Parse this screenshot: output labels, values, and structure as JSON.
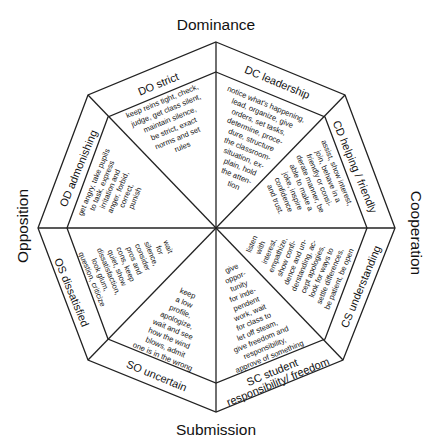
{
  "axes": {
    "top": "Dominance",
    "bottom": "Submission",
    "left": "Opposition",
    "right": "Cooperation"
  },
  "sectors": [
    {
      "code": "DO",
      "label": "DO strict",
      "lines": [
        "keep reins tight, check,",
        "judge, get class silent,",
        "maintain silence,",
        "be strict, exact",
        "norms and set",
        "rules"
      ]
    },
    {
      "code": "DC",
      "label": "DC leadership",
      "lines": [
        "notice what's happening,",
        "lead, organize, give",
        "orders, set tasks,",
        "determine, proce-",
        "dure, structure",
        "the classroom-",
        "situation, ex-",
        "plain, hold",
        "the atten-",
        "tion"
      ]
    },
    {
      "code": "CD",
      "label": "CD helping / friendly",
      "lines": [
        "assist, show interest,",
        "join, behave in a",
        "friendly or consi-",
        "derate manner, be",
        "able to make a",
        "joke, inspire",
        "confidence",
        "and trust."
      ]
    },
    {
      "code": "CS",
      "label": "CS understanding",
      "lines": [
        "listen",
        "with",
        "interest,",
        "empathize,",
        "show confi-",
        "dence and un-",
        "derstanding, ac-",
        "cept apologies,",
        "look for ways to",
        "settle differences,",
        "be patient, be open"
      ]
    },
    {
      "code": "SC",
      "label": "SC student responsibility/ freedom",
      "label_lines": [
        "SC student",
        "responsibility/ freedom"
      ],
      "lines": [
        "give",
        "oppor-",
        "tunity",
        "for inde-",
        "pendent",
        "work, wait",
        "for class to",
        "let off steam,",
        "give freedom and",
        "responsibility,",
        "approve of something"
      ]
    },
    {
      "code": "SO",
      "label": "SO uncertain",
      "lines": [
        "keep",
        "a low",
        "profile,",
        "apologize,",
        "wait and see",
        "how the wind",
        "blows, admit",
        "one is in the wrong"
      ]
    },
    {
      "code": "OS",
      "label": "OS dissatisfied",
      "lines": [
        "wait",
        "for",
        "silence,",
        "consider",
        "pros and",
        "cons, keep",
        "quiet, show",
        "dissatisfaction,",
        "look glum,",
        "question, criticize"
      ]
    },
    {
      "code": "OD",
      "label": "OD admonishing",
      "lines": [
        "get angry, take pupils",
        "to task, express",
        "irritation and",
        "anger, forbid,",
        "correct,",
        "punish"
      ]
    }
  ],
  "colors": {
    "line": "#222222",
    "text": "#111111",
    "background": "#ffffff"
  }
}
